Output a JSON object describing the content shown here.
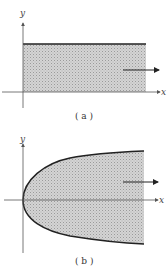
{
  "figure": {
    "panels": [
      {
        "id": "a",
        "caption": "( a )",
        "region_shape": "rectangle (strip between x-axis and a horizontal line, extending to the right)",
        "axis_labels": {
          "x": "x",
          "y": "y"
        },
        "arrow_direction": "right"
      },
      {
        "id": "b",
        "caption": "( b )",
        "region_shape": "region inside a right-opening parabola-like curve with vertex at origin, extending to the right",
        "axis_labels": {
          "x": "x",
          "y": "y"
        },
        "arrow_direction": "right"
      }
    ],
    "colors": {
      "fill": "#c8c8c8",
      "boundary": "#222222",
      "axis": "#555555"
    }
  }
}
